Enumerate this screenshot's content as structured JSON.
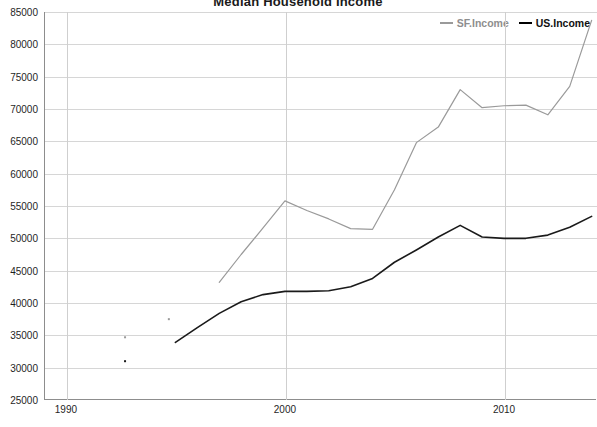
{
  "chart_data": {
    "type": "line",
    "title": "Median Household Income",
    "xlabel": "",
    "ylabel": "",
    "xlim": [
      1989,
      2014.2
    ],
    "ylim": [
      25000,
      85000
    ],
    "grid": true,
    "legend_position": "top-right",
    "x_ticks": [
      "1990",
      "2000",
      "2010"
    ],
    "x_tick_values": [
      1990,
      2000,
      2010
    ],
    "y_ticks": [
      "25000",
      "30000",
      "35000",
      "40000",
      "45000",
      "50000",
      "55000",
      "60000",
      "65000",
      "70000",
      "75000",
      "80000",
      "85000"
    ],
    "y_tick_values": [
      25000,
      30000,
      35000,
      40000,
      45000,
      50000,
      55000,
      60000,
      65000,
      70000,
      75000,
      80000,
      85000
    ],
    "series": [
      {
        "name": "SF.Income",
        "color": "#9a9a9a",
        "x": [
          1997,
          1998,
          1999,
          2000,
          2001,
          2002,
          2003,
          2004,
          2005,
          2006,
          2007,
          2008,
          2009,
          2010,
          2011,
          2012,
          2013,
          2014
        ],
        "values": [
          43200,
          47500,
          51600,
          55800,
          54300,
          53000,
          51500,
          51400,
          57500,
          64800,
          67200,
          73000,
          70200,
          70500,
          70600,
          69100,
          73500,
          83700
        ]
      },
      {
        "name": "US.Income",
        "color": "#1a1a1a",
        "x": [
          1995,
          1996,
          1997,
          1998,
          1999,
          2000,
          2001,
          2002,
          2003,
          2004,
          2005,
          2006,
          2007,
          2008,
          2009,
          2010,
          2011,
          2012,
          2013,
          2014
        ],
        "values": [
          33900,
          36200,
          38400,
          40200,
          41300,
          41800,
          41800,
          41900,
          42500,
          43800,
          46300,
          48200,
          50200,
          52000,
          50200,
          50000,
          50000,
          50500,
          51700,
          53400
        ]
      }
    ],
    "scatter_points": [
      {
        "x": 1992.7,
        "y": 34700,
        "color": "#9a9a9a"
      },
      {
        "x": 1992.7,
        "y": 31000,
        "color": "#1a1a1a"
      },
      {
        "x": 1994.7,
        "y": 37500,
        "color": "#9a9a9a"
      }
    ]
  },
  "legend": {
    "items": [
      {
        "label": "SF.Income",
        "color": "#9a9a9a"
      },
      {
        "label": "US.Income",
        "color": "#1a1a1a"
      }
    ]
  }
}
